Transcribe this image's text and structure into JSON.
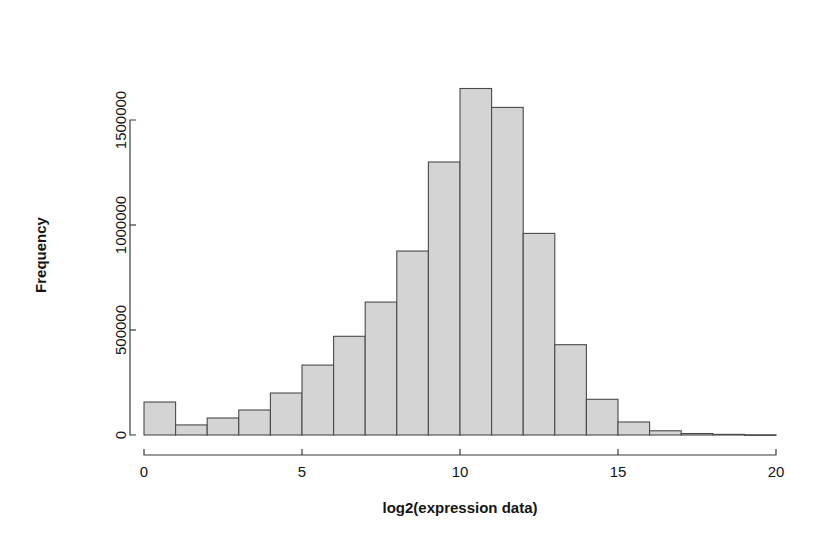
{
  "chart_data": {
    "type": "bar",
    "title": "",
    "xlabel": "log2(expression data)",
    "ylabel": "Frequency",
    "grid": false,
    "legend": "none",
    "xlim": [
      0,
      20
    ],
    "ylim": [
      0,
      1650000
    ],
    "xticks": [
      0,
      5,
      10,
      15,
      20
    ],
    "xtick_labels": [
      "0",
      "5",
      "10",
      "15",
      "20"
    ],
    "yticks": [
      0,
      500000,
      1000000,
      1500000
    ],
    "ytick_labels": [
      "0",
      "500000",
      "1000000",
      "1500000"
    ],
    "bin_width": 1,
    "bin_edges": [
      0,
      1,
      2,
      3,
      4,
      5,
      6,
      7,
      8,
      9,
      10,
      11,
      12,
      13,
      14,
      15,
      16,
      17,
      18,
      19,
      20
    ],
    "bin_centers": [
      0.5,
      1.5,
      2.5,
      3.5,
      4.5,
      5.5,
      6.5,
      7.5,
      8.5,
      9.5,
      10.5,
      11.5,
      12.5,
      13.5,
      14.5,
      15.5,
      16.5,
      17.5,
      18.5,
      19.5
    ],
    "values": [
      157000,
      48000,
      81000,
      119000,
      200000,
      333000,
      470000,
      633000,
      876000,
      1300000,
      1650000,
      1560000,
      960000,
      430000,
      170000,
      62000,
      20000,
      7000,
      3000,
      1000
    ],
    "bar_fill": "#d4d4d4",
    "bar_stroke": "#4a4a4a",
    "axis_color": "#3a3a3a"
  },
  "plot": {
    "x_axis_name": "log2(expression data)",
    "y_axis_name": "Frequency"
  }
}
